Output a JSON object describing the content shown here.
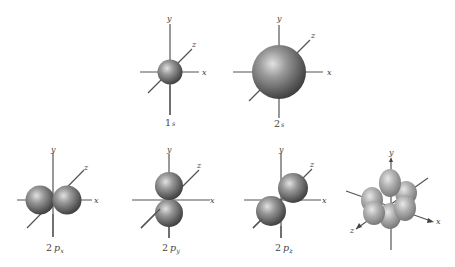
{
  "figure": {
    "colors": {
      "background": "#ffffff",
      "axis": "#555555",
      "sphere_light": "#d4d4d4",
      "sphere_mid": "#8a8a8a",
      "sphere_dark": "#3c3c3c",
      "label": "#444444"
    },
    "axis_labels": {
      "x": "x",
      "y": "y",
      "z": "z"
    },
    "orbitals": [
      {
        "id": "1s",
        "label_main": "1",
        "label_letter": "s",
        "label_sub": "",
        "shape": "sphere-small"
      },
      {
        "id": "2s",
        "label_main": "2",
        "label_letter": "s",
        "label_sub": "",
        "shape": "sphere-large"
      },
      {
        "id": "2px",
        "label_main": "2",
        "label_letter": "p",
        "label_sub": "x",
        "shape": "dumbbell-x"
      },
      {
        "id": "2py",
        "label_main": "2",
        "label_letter": "p",
        "label_sub": "y",
        "shape": "dumbbell-y"
      },
      {
        "id": "2pz",
        "label_main": "2",
        "label_letter": "p",
        "label_sub": "z",
        "shape": "dumbbell-z"
      },
      {
        "id": "d",
        "label_main": "",
        "label_letter": "",
        "label_sub": "",
        "shape": "d-orbital-cluster"
      }
    ]
  }
}
